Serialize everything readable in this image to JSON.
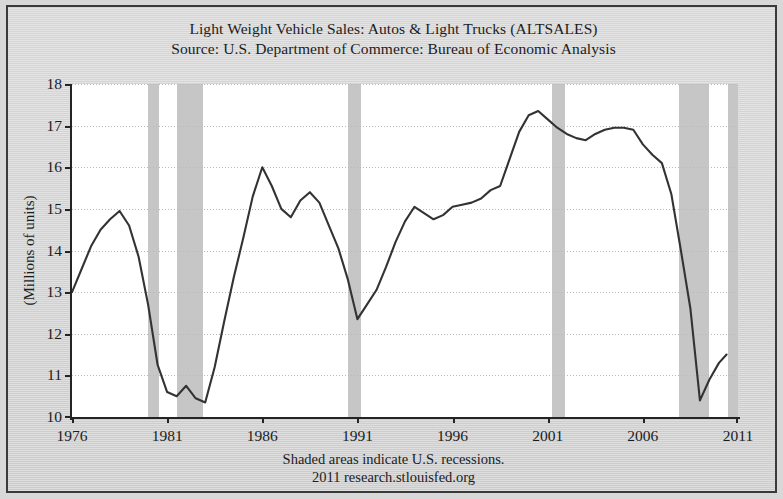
{
  "figure": {
    "title_lines": [
      "Light Weight Vehicle Sales: Autos & Light Trucks (ALTSALES)",
      "Source: U.S. Department of Commerce: Bureau of Economic Analysis"
    ],
    "footer_lines": [
      "Shaded areas indicate U.S. recessions.",
      "2011 research.stlouisfed.org"
    ],
    "colors": {
      "background": "#d6d6d6",
      "plot_background": "#ffffff",
      "line": "#333333",
      "recession_band": "#c6c6c6",
      "axis": "#242424",
      "gridline": "#b9b9b9"
    }
  },
  "chart_data": {
    "type": "line",
    "title": "Light Weight Vehicle Sales: Autos & Light Trucks (ALTSALES)",
    "subtitle": "Source: U.S. Department of Commerce: Bureau of Economic Analysis",
    "xlabel": "",
    "ylabel": "(Millions of units)",
    "xlim": [
      1976,
      2011
    ],
    "ylim": [
      10,
      18
    ],
    "xticks": [
      1976,
      1981,
      1986,
      1991,
      1996,
      2001,
      2006,
      2011
    ],
    "yticks": [
      10,
      11,
      12,
      13,
      14,
      15,
      16,
      17,
      18
    ],
    "grid": true,
    "legend": "none",
    "annotations": [
      "Shaded areas indicate U.S. recessions.",
      "2011 research.stlouisfed.org"
    ],
    "series": [
      {
        "name": "ALTSALES",
        "x": [
          1976.0,
          1976.5,
          1977.0,
          1977.5,
          1978.0,
          1978.5,
          1979.0,
          1979.5,
          1980.0,
          1980.5,
          1981.0,
          1981.5,
          1982.0,
          1982.5,
          1983.0,
          1983.5,
          1984.0,
          1984.5,
          1985.0,
          1985.5,
          1986.0,
          1986.5,
          1987.0,
          1987.5,
          1988.0,
          1988.5,
          1989.0,
          1989.5,
          1990.0,
          1990.5,
          1991.0,
          1991.5,
          1992.0,
          1992.5,
          1993.0,
          1993.5,
          1994.0,
          1994.5,
          1995.0,
          1995.5,
          1996.0,
          1996.5,
          1997.0,
          1997.5,
          1998.0,
          1998.5,
          1999.0,
          1999.5,
          2000.0,
          2000.5,
          2001.0,
          2001.5,
          2002.0,
          2002.5,
          2003.0,
          2003.5,
          2004.0,
          2004.5,
          2005.0,
          2005.5,
          2006.0,
          2006.5,
          2007.0,
          2007.5,
          2008.0,
          2008.5,
          2009.0,
          2009.5,
          2010.0,
          2010.4
        ],
        "y": [
          13.0,
          13.55,
          14.1,
          14.5,
          14.75,
          14.95,
          14.6,
          13.85,
          12.7,
          11.25,
          10.6,
          10.5,
          10.75,
          10.45,
          10.35,
          11.2,
          12.3,
          13.35,
          14.3,
          15.3,
          16.0,
          15.55,
          15.0,
          14.8,
          15.2,
          15.4,
          15.15,
          14.6,
          14.05,
          13.3,
          12.35,
          12.7,
          13.05,
          13.6,
          14.2,
          14.7,
          15.05,
          14.9,
          14.75,
          14.85,
          15.05,
          15.1,
          15.15,
          15.25,
          15.45,
          15.55,
          16.2,
          16.85,
          17.25,
          17.35,
          17.15,
          16.95,
          16.8,
          16.7,
          16.65,
          16.8,
          16.9,
          16.95,
          16.95,
          16.9,
          16.55,
          16.3,
          16.1,
          15.35,
          14.0,
          12.6,
          10.4,
          10.9,
          11.3,
          11.5
        ]
      }
    ],
    "recessions": [
      {
        "label": "1980 recession",
        "start": 1980.0,
        "end": 1980.55
      },
      {
        "label": "1981-1982 recession",
        "start": 1981.5,
        "end": 1982.9
      },
      {
        "label": "1990-1991 recession",
        "start": 1990.5,
        "end": 1991.2
      },
      {
        "label": "2001 recession",
        "start": 2001.2,
        "end": 2001.9
      },
      {
        "label": "2007-2009 recession",
        "start": 2007.9,
        "end": 2009.5
      },
      {
        "label": "post-2010 shaded",
        "start": 2010.5,
        "end": 2011.0
      }
    ]
  }
}
